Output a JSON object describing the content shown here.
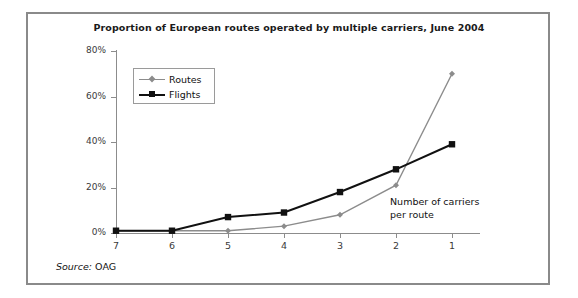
{
  "frame": {
    "border_color": "#8a8a8a",
    "background": "#ffffff"
  },
  "source": {
    "label": "Source:",
    "value": "OAG"
  },
  "annotation": {
    "line1": "Number of carriers",
    "line2": "per route"
  },
  "legend": {
    "position": "top-left-inside",
    "entries": [
      {
        "name": "Routes",
        "color": "#8c8c8c",
        "marker": "diamond"
      },
      {
        "name": "Flights",
        "color": "#111111",
        "marker": "square"
      }
    ]
  },
  "chart_data": {
    "type": "line",
    "title": "Proportion of European routes operated by multiple carriers, June 2004",
    "xlabel": "Number of carriers per route",
    "ylabel": "",
    "categories": [
      "7",
      "6",
      "5",
      "4",
      "3",
      "2",
      "1"
    ],
    "x": [
      7,
      6,
      5,
      4,
      3,
      2,
      1
    ],
    "ylim": [
      0,
      80
    ],
    "yticks": [
      0,
      20,
      40,
      60,
      80
    ],
    "ytick_labels": [
      "0%",
      "20%",
      "40%",
      "60%",
      "80%"
    ],
    "grid": false,
    "series": [
      {
        "name": "Routes",
        "color": "#8c8c8c",
        "marker": "diamond",
        "values": [
          1,
          1,
          1,
          3,
          8,
          21,
          70
        ]
      },
      {
        "name": "Flights",
        "color": "#111111",
        "marker": "square",
        "values": [
          1,
          1,
          7,
          9,
          18,
          28,
          39
        ]
      }
    ]
  }
}
